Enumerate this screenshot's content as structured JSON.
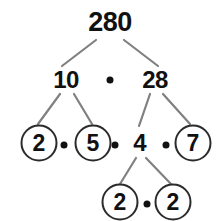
{
  "diagram": {
    "type": "factor-tree",
    "canvas": {
      "width": 216,
      "height": 221,
      "background": "#ffffff"
    },
    "colors": {
      "text": "#111111",
      "edge": "#808080",
      "circle_stroke": "#2b2b2b",
      "background": "#ffffff"
    },
    "nodes": [
      {
        "id": "n280",
        "label": "280",
        "x": 110,
        "y": 22,
        "circled": false,
        "style": "root"
      },
      {
        "id": "n10",
        "label": "10",
        "x": 66,
        "y": 80,
        "circled": false,
        "style": "level1"
      },
      {
        "id": "n28",
        "label": "28",
        "x": 155,
        "y": 80,
        "circled": false,
        "style": "level1"
      },
      {
        "id": "n2a",
        "label": "2",
        "x": 39,
        "y": 143,
        "circled": true,
        "style": "circled"
      },
      {
        "id": "n5",
        "label": "5",
        "x": 93,
        "y": 143,
        "circled": true,
        "style": "circled"
      },
      {
        "id": "n4",
        "label": "4",
        "x": 140,
        "y": 143,
        "circled": false,
        "style": "plain"
      },
      {
        "id": "n7",
        "label": "7",
        "x": 193,
        "y": 143,
        "circled": true,
        "style": "circled"
      },
      {
        "id": "n2b",
        "label": "2",
        "x": 120,
        "y": 202,
        "circled": true,
        "style": "circled"
      },
      {
        "id": "n2c",
        "label": "2",
        "x": 173,
        "y": 202,
        "circled": true,
        "style": "circled"
      }
    ],
    "operator_dots": [
      {
        "id": "dot-top",
        "symbol": "•",
        "x": 110,
        "y": 80
      },
      {
        "id": "dot-r3-1",
        "symbol": "•",
        "x": 64,
        "y": 145
      },
      {
        "id": "dot-r3-2",
        "symbol": "•",
        "x": 115,
        "y": 145
      },
      {
        "id": "dot-r3-3",
        "symbol": "•",
        "x": 166,
        "y": 145
      },
      {
        "id": "dot-r4-1",
        "symbol": "•",
        "x": 147,
        "y": 204
      }
    ],
    "edges": [
      {
        "id": "e280-10",
        "from": "n280",
        "to": "n10",
        "x1": 96,
        "y1": 40,
        "x2": 62,
        "y2": 66
      },
      {
        "id": "e280-28",
        "from": "n280",
        "to": "n28",
        "x1": 124,
        "y1": 40,
        "x2": 158,
        "y2": 66
      },
      {
        "id": "e10-2",
        "from": "n10",
        "to": "n2a",
        "x1": 60,
        "y1": 94,
        "x2": 38,
        "y2": 124
      },
      {
        "id": "e10-5",
        "from": "n10",
        "to": "n5",
        "x1": 74,
        "y1": 94,
        "x2": 92,
        "y2": 124
      },
      {
        "id": "e28-4",
        "from": "n28",
        "to": "n4",
        "x1": 150,
        "y1": 94,
        "x2": 139,
        "y2": 126
      },
      {
        "id": "e28-7",
        "from": "n28",
        "to": "n7",
        "x1": 163,
        "y1": 94,
        "x2": 190,
        "y2": 124
      },
      {
        "id": "e4-2b",
        "from": "n4",
        "to": "n2b",
        "x1": 136,
        "y1": 158,
        "x2": 120,
        "y2": 184
      },
      {
        "id": "e4-2c",
        "from": "n4",
        "to": "n2c",
        "x1": 146,
        "y1": 158,
        "x2": 171,
        "y2": 184
      }
    ]
  }
}
